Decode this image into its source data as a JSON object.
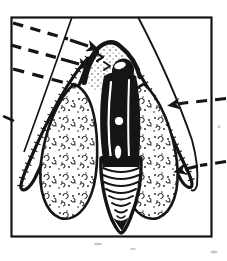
{
  "figure": {
    "type": "scanned-black-and-white-line-illustration",
    "colors": {
      "background": "#ffffff",
      "paper": "#ffffff",
      "ink": "#151515",
      "noise": "#c6c6c6"
    },
    "frame": {
      "shape": "rectangle",
      "style": "thin-black-border"
    },
    "parts": [
      {
        "name": "outer-sheath-left-edge",
        "style": "thin-solid-line"
      },
      {
        "name": "outer-sheath-right-edge",
        "style": "thin-solid-line"
      },
      {
        "name": "left-leaf-blade",
        "style": "thick-hairy-outline-loop"
      },
      {
        "name": "right-leaf-blade",
        "style": "thick-hairy-outline-loop"
      },
      {
        "name": "left-stippled-lobe",
        "texture": "dots-and-curls"
      },
      {
        "name": "right-stippled-lobe",
        "texture": "dots-and-curls"
      },
      {
        "name": "apical-dome",
        "texture": "stipple-dots"
      },
      {
        "name": "dark-ovoid-body",
        "detail": "white-highlight"
      },
      {
        "name": "central-axis",
        "style": "dark-with-white-streaks-and-spots"
      },
      {
        "name": "scaly-cone-tip",
        "rings": 8
      }
    ],
    "annotations": {
      "left_leaders": [
        {
          "name": "leader-1",
          "style": "dashed",
          "arrowhead": true,
          "direction": "right-down"
        },
        {
          "name": "leader-2",
          "style": "dashed",
          "arrowhead": true,
          "direction": "right-down"
        },
        {
          "name": "leader-3",
          "style": "dashed",
          "arrowhead": false,
          "direction": "right-down"
        }
      ],
      "right_leaders": [
        {
          "name": "leader-4",
          "style": "dashed",
          "arrowhead": true,
          "direction": "left"
        },
        {
          "name": "leader-5",
          "style": "dashed",
          "arrowhead": true,
          "direction": "left"
        }
      ],
      "dome_chevrons": 2
    }
  }
}
